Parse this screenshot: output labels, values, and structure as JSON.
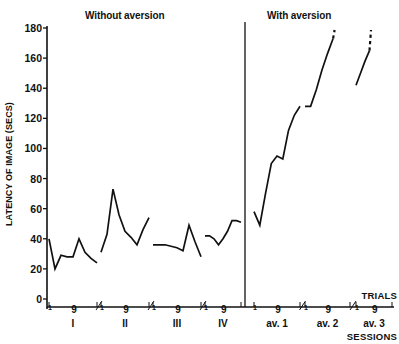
{
  "titles": {
    "left_panel": "Without aversion",
    "right_panel": "With aversion"
  },
  "axes": {
    "y_label": "LATENCY OF IMAGE (SECS)",
    "y_ticks": [
      0,
      20,
      40,
      60,
      80,
      100,
      120,
      140,
      160,
      180
    ],
    "x_axis_caption_trials": "TRIALS",
    "x_axis_caption_sessions": "SESSIONS",
    "trial_start_label": "1",
    "trial_end_label": "9"
  },
  "sessions": [
    {
      "id": "I",
      "label": "I",
      "group": "without"
    },
    {
      "id": "II",
      "label": "II",
      "group": "without"
    },
    {
      "id": "III",
      "label": "III",
      "group": "without"
    },
    {
      "id": "IV",
      "label": "IV",
      "group": "without"
    },
    {
      "id": "av1",
      "label": "av. 1",
      "group": "with"
    },
    {
      "id": "av2",
      "label": "av. 2",
      "group": "with"
    },
    {
      "id": "av3",
      "label": "av. 3",
      "group": "with"
    }
  ],
  "chart_data": {
    "type": "line",
    "xlabel": "SESSIONS",
    "ylabel": "LATENCY OF IMAGE (SECS)",
    "ylim": [
      0,
      180
    ],
    "ytick_values": [
      0,
      20,
      40,
      60,
      80,
      100,
      120,
      140,
      160,
      180
    ],
    "grid": false,
    "legend": "none",
    "x_is_categorical": true,
    "trials_per_session": 9,
    "panels": [
      {
        "name": "Without aversion",
        "sessions": [
          "I",
          "II",
          "III",
          "IV"
        ]
      },
      {
        "name": "With aversion",
        "sessions": [
          "av. 1",
          "av. 2",
          "av. 3"
        ]
      }
    ],
    "series": [
      {
        "name": "Session I",
        "session": "I",
        "style": "solid",
        "trials": [
          1,
          2,
          3,
          4,
          5,
          6,
          7,
          8,
          9
        ],
        "values": [
          40,
          20,
          29,
          28,
          28,
          40,
          31,
          27,
          24
        ]
      },
      {
        "name": "Session II",
        "session": "II",
        "style": "solid",
        "trials": [
          1,
          2,
          3,
          4,
          5,
          6,
          7,
          8,
          9
        ],
        "values": [
          31,
          43,
          73,
          56,
          45,
          41,
          36,
          46,
          54
        ]
      },
      {
        "name": "Session III",
        "session": "III",
        "style": "solid",
        "trials": [
          1,
          2,
          3,
          4,
          5,
          6,
          7,
          8,
          9
        ],
        "values": [
          36,
          36,
          36,
          35,
          34,
          32,
          49,
          38,
          28
        ]
      },
      {
        "name": "Session IV",
        "session": "IV",
        "style": "solid",
        "trials": [
          1,
          2,
          3,
          4,
          5,
          6,
          7,
          8,
          9
        ],
        "values": [
          42,
          42,
          40,
          36,
          40,
          45,
          52,
          52,
          51
        ]
      },
      {
        "name": "Session av. 1",
        "session": "av. 1",
        "style": "solid",
        "trials": [
          1,
          2,
          3,
          4,
          5,
          6,
          7,
          8,
          9
        ],
        "values": [
          58,
          49,
          70,
          90,
          95,
          93,
          112,
          122,
          128
        ]
      },
      {
        "name": "Session av. 2",
        "session": "av. 2",
        "style": "solid-then-dashed",
        "trials": [
          1,
          2,
          3,
          4,
          5,
          6,
          7,
          8,
          9
        ],
        "values": [
          128,
          128,
          139,
          152,
          163,
          173,
          180,
          180,
          180
        ],
        "dashed_from_trial": 6,
        "note": "line exits top of axis as dashed segment above 160"
      },
      {
        "name": "Session av. 3",
        "session": "av. 3",
        "style": "solid-then-dashed",
        "trials": [
          1,
          2,
          3,
          4,
          5,
          6,
          7,
          8,
          9
        ],
        "values": [
          142,
          150,
          158,
          165,
          175,
          180,
          180,
          180,
          180
        ],
        "dashed_from_trial": 4,
        "note": "line exits top of axis as dashed segment above 160"
      }
    ]
  },
  "colors": {
    "ink": "#111111",
    "background": "#ffffff",
    "line": "#111111"
  }
}
